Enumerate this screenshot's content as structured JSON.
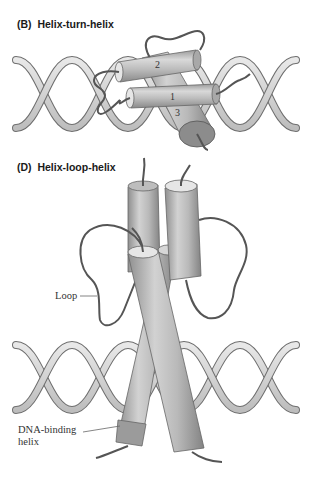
{
  "figure": {
    "panels": [
      {
        "id": "B",
        "letter": "(B)",
        "title": "Helix-turn-helix",
        "helix_numbers": [
          "1",
          "2",
          "3"
        ]
      },
      {
        "id": "D",
        "letter": "(D)",
        "title": "Helix-loop-helix",
        "labels": {
          "loop": "Loop",
          "dna_binding_line1": "DNA-binding",
          "dna_binding_line2": "helix"
        }
      }
    ],
    "colors": {
      "dna_ribbon": "#d4d4d4",
      "dna_edge": "#6e6e6e",
      "cylinder_body": "#b5b5b5",
      "cylinder_cap": "#e6e6e6",
      "loop_line": "#555555"
    }
  }
}
